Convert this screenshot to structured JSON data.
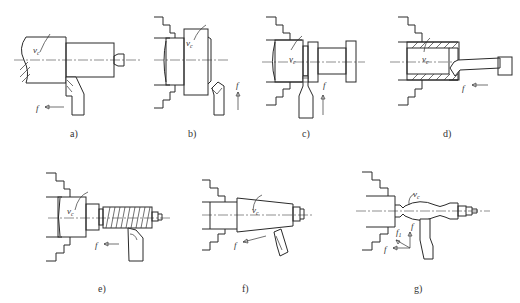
{
  "figure": {
    "header_fragment": "",
    "panels": [
      {
        "id": "a",
        "label": "a)",
        "operation": "external turning",
        "speed_symbol": "v",
        "speed_subscript": "c",
        "feed_symbol": "f"
      },
      {
        "id": "b",
        "label": "b)",
        "operation": "facing",
        "speed_symbol": "v",
        "speed_subscript": "c",
        "feed_symbol": "f"
      },
      {
        "id": "c",
        "label": "c)",
        "operation": "grooving / parting",
        "speed_symbol": "v",
        "speed_subscript": "c",
        "feed_symbol": "f"
      },
      {
        "id": "d",
        "label": "d)",
        "operation": "boring",
        "speed_symbol": "v",
        "speed_subscript": "c",
        "feed_symbol": "f"
      },
      {
        "id": "e",
        "label": "e)",
        "operation": "thread turning",
        "speed_symbol": "v",
        "speed_subscript": "c",
        "feed_symbol": "f"
      },
      {
        "id": "f",
        "label": "f)",
        "operation": "taper turning",
        "speed_symbol": "v",
        "speed_subscript": "c",
        "feed_symbol": "f"
      },
      {
        "id": "g",
        "label": "g)",
        "operation": "form turning",
        "speed_symbol": "v",
        "speed_subscript": "c",
        "feed_symbol": "f",
        "feed_symbol_2": "f",
        "feed_subscript_2": "1"
      }
    ]
  }
}
